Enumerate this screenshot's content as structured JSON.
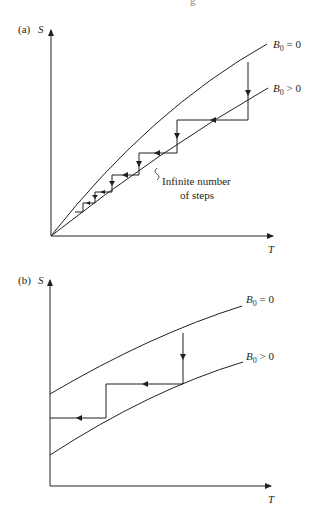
{
  "header_fragment": "g",
  "panels": [
    {
      "id": "a",
      "label": "(a)",
      "y_axis": "S",
      "x_axis": "T",
      "curves": [
        {
          "name": "upper",
          "label_main": "B",
          "label_sub": "0",
          "label_rest": " = 0"
        },
        {
          "name": "lower",
          "label_main": "B",
          "label_sub": "0",
          "label_rest": " > 0"
        }
      ],
      "annotation_line1": "Infinite number",
      "annotation_line2": "of steps"
    },
    {
      "id": "b",
      "label": "(b)",
      "y_axis": "S",
      "x_axis": "T",
      "curves": [
        {
          "name": "upper",
          "label_main": "B",
          "label_sub": "0",
          "label_rest": " = 0"
        },
        {
          "name": "lower",
          "label_main": "B",
          "label_sub": "0",
          "label_rest": " > 0"
        }
      ]
    }
  ],
  "colors": {
    "ink": "#231f20",
    "background": "#ffffff"
  }
}
